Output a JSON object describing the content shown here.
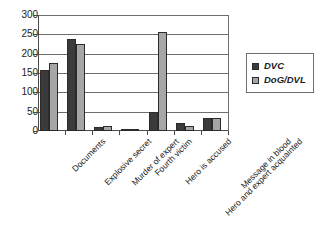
{
  "chart_data": {
    "type": "bar",
    "title": "",
    "subtitle": "",
    "xlabel": "",
    "ylabel": "",
    "ylim": [
      0,
      300
    ],
    "yticks": [
      0,
      50,
      100,
      150,
      200,
      250,
      300
    ],
    "grid": true,
    "legend_position": "right",
    "categories": [
      "Documents",
      "Explosive secret",
      "Murder of expert",
      "Fourth victim",
      "Hero is accused",
      "Hero and expert acquainted",
      "Message in blood"
    ],
    "series": [
      {
        "name": "DVC",
        "color": "#3b3b3b",
        "values": [
          158,
          238,
          11,
          4,
          48,
          22,
          34
        ]
      },
      {
        "name": "DoG/DVL",
        "color": "#a6a6a6",
        "values": [
          175,
          224,
          12,
          4,
          256,
          14,
          33
        ]
      }
    ]
  },
  "legend": {
    "items": [
      {
        "label": "DVC",
        "swatch": "#3b3b3b"
      },
      {
        "label": "DoG/DVL",
        "swatch": "#a6a6a6"
      }
    ]
  },
  "colors": {
    "series_dvc": "#3b3b3b",
    "series_dog_dvl": "#a6a6a6",
    "axis": "#4a4a4a",
    "gridline": "#6e6e6e",
    "background": "#ffffff",
    "text": "#1a1a1a"
  }
}
